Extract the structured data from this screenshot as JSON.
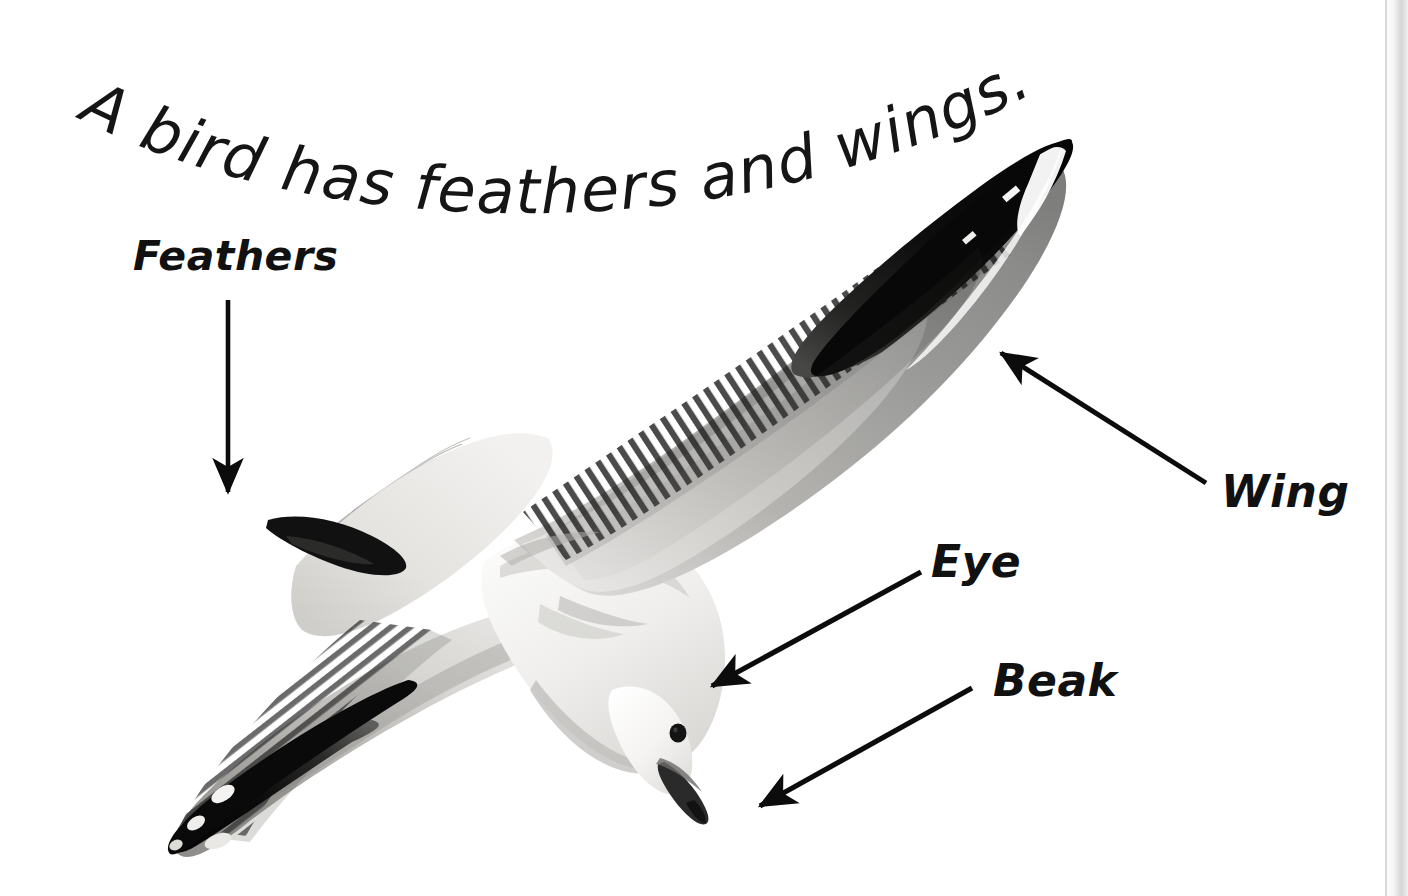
{
  "page": {
    "background_color": "#ffffff",
    "kind": "educational book page photo with labelled diagram",
    "edge_shadow_color": "#cecece"
  },
  "title": {
    "text": "A bird has feathers and wings.",
    "style": "curved-arc handwriting-style sans-serif",
    "color": "#151515",
    "chars": [
      "A",
      " ",
      "b",
      "i",
      "r",
      "d",
      " ",
      "h",
      "a",
      "s",
      " ",
      "f",
      "e",
      "a",
      "t",
      "h",
      "e",
      "r",
      "s",
      " ",
      "a",
      "n",
      "d",
      " ",
      "w",
      "i",
      "n",
      "g",
      "s",
      "."
    ]
  },
  "labels": [
    {
      "id": "feathers",
      "text": "Feathers",
      "color": "#111111"
    },
    {
      "id": "wing",
      "text": "Wing",
      "color": "#111111"
    },
    {
      "id": "eye",
      "text": "Eye",
      "color": "#111111"
    },
    {
      "id": "beak",
      "text": "Beak",
      "color": "#111111"
    }
  ],
  "arrows": [
    {
      "id": "feathers-arrow",
      "from": [
        228,
        300
      ],
      "to": [
        228,
        492
      ],
      "direction": "down",
      "points_at": "tail feathers"
    },
    {
      "id": "wing-arrow",
      "from": [
        1206,
        483
      ],
      "to": [
        1000,
        352
      ],
      "direction": "up-left",
      "points_at": "right wing"
    },
    {
      "id": "eye-arrow",
      "from": [
        921,
        572
      ],
      "to": [
        711,
        686
      ],
      "direction": "down-left",
      "points_at": "eye"
    },
    {
      "id": "beak-arrow",
      "from": [
        972,
        688
      ],
      "to": [
        759,
        806
      ],
      "direction": "down-left",
      "points_at": "beak"
    }
  ],
  "subject": {
    "name": "seagull in flight",
    "description": "black-and-white photo of a gull gliding, wings spread, head down-right",
    "colors": {
      "body_light": "#f1f0ee",
      "wing_gray": "#9b9b9b",
      "wing_gray_dark": "#7c7c7c",
      "wingtip_black": "#0d0d0d",
      "eye_black": "#141414",
      "beak_dark": "#2a2a2a"
    },
    "parts": [
      "feathers",
      "wing",
      "eye",
      "beak",
      "tail"
    ]
  }
}
